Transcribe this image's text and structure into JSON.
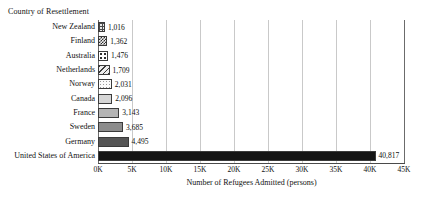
{
  "chart_data": {
    "type": "bar",
    "orientation": "horizontal",
    "title": "",
    "ylabel": "Country of Resettlement",
    "xlabel": "Number of Refugees Admitted (persons)",
    "categories": [
      "New Zealand",
      "Finland",
      "Australia",
      "Netherlands",
      "Norway",
      "Canada",
      "France",
      "Sweden",
      "Germany",
      "United States of America"
    ],
    "values": [
      1016,
      1362,
      1476,
      1709,
      2031,
      2096,
      3143,
      3685,
      4495,
      40817
    ],
    "value_labels": [
      "1,016",
      "1,362",
      "1,476",
      "1,709",
      "2,031",
      "2,096",
      "3,143",
      "3,685",
      "4,495",
      "40,817"
    ],
    "xlim": [
      0,
      45000
    ],
    "xticks": [
      0,
      5000,
      10000,
      15000,
      20000,
      25000,
      30000,
      35000,
      40000,
      45000
    ],
    "xtick_labels": [
      "0K",
      "5K",
      "10K",
      "15K",
      "20K",
      "25K",
      "30K",
      "35K",
      "40K",
      "45K"
    ],
    "grid": true,
    "grid_axis": "x",
    "legend": "none",
    "bar_styles": [
      {
        "pattern": "grid-crosshatch",
        "color": "#e8e8e8"
      },
      {
        "pattern": "dense-checker",
        "color": "#2e2e2e"
      },
      {
        "pattern": "large-dots",
        "color": "#ffffff"
      },
      {
        "pattern": "diagonal-stripes",
        "color": "#ededed"
      },
      {
        "pattern": "fine-dots",
        "color": "#fbfbfb"
      },
      {
        "pattern": "solid",
        "color": "#d6d6d6"
      },
      {
        "pattern": "solid",
        "color": "#b4b4b4"
      },
      {
        "pattern": "solid",
        "color": "#8c8c8c"
      },
      {
        "pattern": "solid",
        "color": "#555555"
      },
      {
        "pattern": "solid",
        "color": "#151515"
      }
    ]
  }
}
